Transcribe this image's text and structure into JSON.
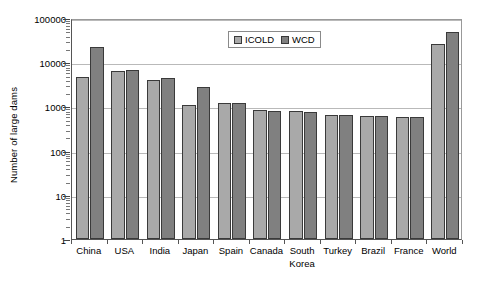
{
  "chart_data": {
    "type": "bar",
    "title": "",
    "xlabel": "",
    "ylabel": "Number of large dams",
    "yscale": "log",
    "ylim": [
      1,
      100000
    ],
    "ytick_labels": [
      "100000",
      "10000",
      "1000",
      "100",
      "10",
      "1"
    ],
    "ytick_values": [
      100000,
      10000,
      1000,
      100,
      10,
      1
    ],
    "grid": true,
    "legend_position": "top-center",
    "categories": [
      "China",
      "USA",
      "India",
      "Japan",
      "Spain",
      "Canada",
      "South\nKorea",
      "Turkey",
      "Brazil",
      "France",
      "World"
    ],
    "series": [
      {
        "name": "ICOLD",
        "color": "#a9a9a9",
        "values": [
          4600,
          6390,
          4050,
          1090,
          1190,
          820,
          790,
          625,
          595,
          570,
          25400
        ]
      },
      {
        "name": "WCD",
        "color": "#808080",
        "values": [
          22000,
          6575,
          4291,
          2700,
          1196,
          793,
          765,
          625,
          594,
          569,
          47655
        ]
      }
    ]
  },
  "legend": {
    "items": [
      {
        "label": "ICOLD",
        "swatch": "icold"
      },
      {
        "label": "WCD",
        "swatch": "wcd"
      }
    ]
  },
  "colors": {
    "icold": "#a9a9a9",
    "wcd": "#808080",
    "grid": "#b9b9b9",
    "axis": "#555555",
    "background": "#ffffff"
  }
}
